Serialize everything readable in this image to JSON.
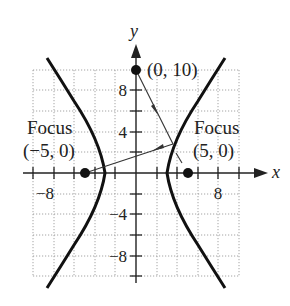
{
  "diagram": {
    "equation": "x^2/9 - y^2/16 = 1",
    "axes": {
      "x_label": "x",
      "y_label": "y",
      "x_tick_labels": [
        "−8",
        "8"
      ],
      "y_tick_labels": [
        "8",
        "4",
        "−4",
        "−8"
      ],
      "x_range": [
        -10,
        10
      ],
      "y_range": [
        -10,
        10
      ],
      "grid": true,
      "grid_step": 2
    },
    "points": [
      {
        "name": "left-focus",
        "label_line1": "Focus",
        "label_line2": "(−5, 0)",
        "x": -5,
        "y": 0
      },
      {
        "name": "right-focus",
        "label_line1": "Focus",
        "label_line2": "(5, 0)",
        "x": 5,
        "y": 0
      },
      {
        "name": "source-point",
        "label": "(0, 10)",
        "x": 0,
        "y": 10
      }
    ],
    "rays": [
      {
        "from": [
          0,
          10
        ],
        "to": [
          3.6,
          2.8
        ],
        "description": "ray toward right focus"
      },
      {
        "from": [
          3.6,
          2.8
        ],
        "to": [
          -5,
          0
        ],
        "description": "reflected ray toward left focus"
      }
    ],
    "colors": {
      "curve": "#111111",
      "grid": "#9a9a9a",
      "axis": "#222222",
      "background": "#ffffff"
    }
  }
}
